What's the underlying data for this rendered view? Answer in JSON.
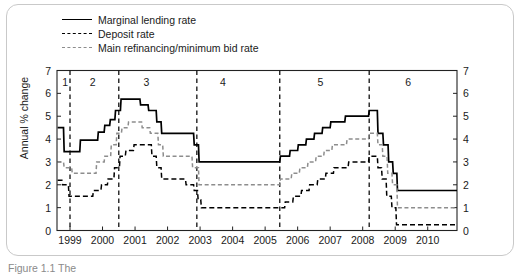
{
  "figure": {
    "caption": "Figure 1.1 The",
    "ylabel": "Annual % change"
  },
  "legend": {
    "position": "top-left",
    "items": [
      {
        "label": "Marginal lending rate",
        "style": "solid",
        "color": "#000000"
      },
      {
        "label": "Deposit rate",
        "style": "dashed",
        "color": "#000000"
      },
      {
        "label": "Main refinancing/minimum bid rate",
        "style": "dashed",
        "color": "#8d8d8d"
      }
    ]
  },
  "chart_data": {
    "type": "line",
    "title": "",
    "xlabel": "",
    "ylabel": "Annual % change",
    "ylim": [
      0,
      7
    ],
    "yticks": [
      0,
      1,
      2,
      3,
      4,
      5,
      6,
      7
    ],
    "right_axis": true,
    "right_yticks": [
      0,
      1,
      2,
      3,
      4,
      5,
      6,
      7
    ],
    "xlim": [
      1998.6,
      2010.9
    ],
    "xticks": [
      1999,
      2000,
      2001,
      2002,
      2003,
      2004,
      2005,
      2006,
      2007,
      2008,
      2009,
      2010
    ],
    "xticklabels": [
      "1999",
      "2000",
      "2001",
      "2002",
      "2003",
      "2004",
      "2005",
      "2006",
      "2007",
      "2008",
      "2009",
      "2010"
    ],
    "grid": false,
    "step": "post",
    "annotations": [
      {
        "label": "1",
        "x": 1998.85
      },
      {
        "label": "2",
        "x": 1999.7
      },
      {
        "label": "3",
        "x": 2001.35
      },
      {
        "label": "4",
        "x": 2003.7
      },
      {
        "label": "5",
        "x": 2006.7
      },
      {
        "label": "6",
        "x": 2009.4
      }
    ],
    "vlines": [
      1999.0,
      2000.5,
      2002.9,
      2005.45,
      2008.2
    ],
    "series": [
      {
        "name": "Marginal lending rate",
        "style": "solid",
        "color": "#000000",
        "points": [
          [
            1998.62,
            4.5
          ],
          [
            1998.8,
            4.5
          ],
          [
            1998.82,
            3.45
          ],
          [
            1999.3,
            3.45
          ],
          [
            1999.32,
            3.95
          ],
          [
            1999.85,
            3.95
          ],
          [
            1999.87,
            4.3
          ],
          [
            2000.05,
            4.3
          ],
          [
            2000.07,
            4.6
          ],
          [
            2000.22,
            4.6
          ],
          [
            2000.24,
            4.85
          ],
          [
            2000.38,
            4.85
          ],
          [
            2000.4,
            5.25
          ],
          [
            2000.55,
            5.25
          ],
          [
            2000.57,
            5.75
          ],
          [
            2000.8,
            5.75
          ],
          [
            2000.82,
            5.75
          ],
          [
            2001.15,
            5.75
          ],
          [
            2001.17,
            5.5
          ],
          [
            2001.4,
            5.5
          ],
          [
            2001.42,
            5.25
          ],
          [
            2001.65,
            5.25
          ],
          [
            2001.67,
            4.75
          ],
          [
            2001.8,
            4.75
          ],
          [
            2001.82,
            4.25
          ],
          [
            2002.8,
            4.25
          ],
          [
            2002.82,
            3.75
          ],
          [
            2002.95,
            3.75
          ],
          [
            2002.97,
            3.0
          ],
          [
            2005.45,
            3.0
          ],
          [
            2005.47,
            3.25
          ],
          [
            2005.75,
            3.25
          ],
          [
            2005.77,
            3.5
          ],
          [
            2006.0,
            3.5
          ],
          [
            2006.02,
            3.75
          ],
          [
            2006.25,
            3.75
          ],
          [
            2006.27,
            4.0
          ],
          [
            2006.5,
            4.0
          ],
          [
            2006.52,
            4.25
          ],
          [
            2006.75,
            4.25
          ],
          [
            2006.77,
            4.5
          ],
          [
            2007.0,
            4.5
          ],
          [
            2007.02,
            4.75
          ],
          [
            2007.45,
            4.75
          ],
          [
            2007.47,
            5.0
          ],
          [
            2008.18,
            5.0
          ],
          [
            2008.2,
            5.25
          ],
          [
            2008.45,
            5.25
          ],
          [
            2008.47,
            4.25
          ],
          [
            2008.62,
            4.25
          ],
          [
            2008.64,
            3.75
          ],
          [
            2008.78,
            3.75
          ],
          [
            2008.8,
            3.0
          ],
          [
            2008.92,
            3.0
          ],
          [
            2008.94,
            2.5
          ],
          [
            2009.05,
            2.5
          ],
          [
            2009.07,
            1.75
          ],
          [
            2010.9,
            1.75
          ]
        ]
      },
      {
        "name": "Main refinancing/minimum bid rate",
        "style": "dashed",
        "color": "#8d8d8d",
        "points": [
          [
            1998.62,
            3.0
          ],
          [
            1998.8,
            3.0
          ],
          [
            1998.82,
            2.75
          ],
          [
            1999.05,
            2.75
          ],
          [
            1999.07,
            2.5
          ],
          [
            1999.3,
            2.5
          ],
          [
            1999.32,
            2.5
          ],
          [
            1999.8,
            2.5
          ],
          [
            1999.82,
            3.0
          ],
          [
            2000.05,
            3.0
          ],
          [
            2000.07,
            3.25
          ],
          [
            2000.25,
            3.25
          ],
          [
            2000.27,
            3.75
          ],
          [
            2000.42,
            3.75
          ],
          [
            2000.44,
            4.25
          ],
          [
            2000.58,
            4.25
          ],
          [
            2000.6,
            4.5
          ],
          [
            2000.78,
            4.5
          ],
          [
            2000.8,
            4.75
          ],
          [
            2001.2,
            4.75
          ],
          [
            2001.22,
            4.5
          ],
          [
            2001.45,
            4.5
          ],
          [
            2001.47,
            4.25
          ],
          [
            2001.7,
            4.25
          ],
          [
            2001.72,
            3.75
          ],
          [
            2001.85,
            3.75
          ],
          [
            2001.87,
            3.25
          ],
          [
            2002.75,
            3.25
          ],
          [
            2002.77,
            2.75
          ],
          [
            2002.95,
            2.75
          ],
          [
            2002.97,
            2.0
          ],
          [
            2005.45,
            2.0
          ],
          [
            2005.47,
            2.25
          ],
          [
            2005.8,
            2.25
          ],
          [
            2005.82,
            2.5
          ],
          [
            2006.05,
            2.5
          ],
          [
            2006.07,
            2.75
          ],
          [
            2006.3,
            2.75
          ],
          [
            2006.32,
            3.0
          ],
          [
            2006.55,
            3.0
          ],
          [
            2006.57,
            3.25
          ],
          [
            2006.8,
            3.25
          ],
          [
            2006.82,
            3.5
          ],
          [
            2007.05,
            3.5
          ],
          [
            2007.07,
            3.75
          ],
          [
            2007.5,
            3.75
          ],
          [
            2007.52,
            4.0
          ],
          [
            2008.18,
            4.0
          ],
          [
            2008.2,
            4.25
          ],
          [
            2008.45,
            4.25
          ],
          [
            2008.47,
            3.75
          ],
          [
            2008.6,
            3.75
          ],
          [
            2008.62,
            3.25
          ],
          [
            2008.75,
            3.25
          ],
          [
            2008.77,
            2.5
          ],
          [
            2008.9,
            2.5
          ],
          [
            2008.92,
            2.0
          ],
          [
            2009.05,
            2.0
          ],
          [
            2009.07,
            1.0
          ],
          [
            2010.9,
            1.0
          ]
        ]
      },
      {
        "name": "Deposit rate",
        "style": "dashed",
        "color": "#000000",
        "points": [
          [
            1998.62,
            2.2
          ],
          [
            1998.75,
            2.2
          ],
          [
            1998.77,
            2.0
          ],
          [
            1998.95,
            2.0
          ],
          [
            1998.97,
            1.5
          ],
          [
            1999.45,
            1.5
          ],
          [
            1999.47,
            1.5
          ],
          [
            1999.7,
            1.5
          ],
          [
            1999.72,
            1.75
          ],
          [
            1999.95,
            1.75
          ],
          [
            1999.97,
            2.0
          ],
          [
            2000.15,
            2.0
          ],
          [
            2000.17,
            2.25
          ],
          [
            2000.35,
            2.25
          ],
          [
            2000.37,
            2.75
          ],
          [
            2000.52,
            2.75
          ],
          [
            2000.54,
            3.25
          ],
          [
            2000.7,
            3.25
          ],
          [
            2000.72,
            3.5
          ],
          [
            2000.95,
            3.5
          ],
          [
            2000.97,
            3.75
          ],
          [
            2001.25,
            3.75
          ],
          [
            2001.27,
            3.75
          ],
          [
            2001.5,
            3.75
          ],
          [
            2001.52,
            3.25
          ],
          [
            2001.65,
            3.25
          ],
          [
            2001.67,
            2.75
          ],
          [
            2001.8,
            2.75
          ],
          [
            2001.82,
            2.25
          ],
          [
            2002.55,
            2.25
          ],
          [
            2002.57,
            2.0
          ],
          [
            2002.8,
            2.0
          ],
          [
            2002.82,
            1.75
          ],
          [
            2002.92,
            1.75
          ],
          [
            2002.94,
            1.35
          ],
          [
            2003.02,
            1.35
          ],
          [
            2003.04,
            1.0
          ],
          [
            2005.45,
            1.0
          ],
          [
            2005.47,
            1.0
          ],
          [
            2005.6,
            1.0
          ],
          [
            2005.62,
            1.25
          ],
          [
            2005.85,
            1.25
          ],
          [
            2005.87,
            1.5
          ],
          [
            2006.1,
            1.5
          ],
          [
            2006.12,
            1.75
          ],
          [
            2006.35,
            1.75
          ],
          [
            2006.37,
            2.0
          ],
          [
            2006.6,
            2.0
          ],
          [
            2006.62,
            2.25
          ],
          [
            2006.85,
            2.25
          ],
          [
            2006.87,
            2.5
          ],
          [
            2007.1,
            2.5
          ],
          [
            2007.12,
            2.75
          ],
          [
            2007.55,
            2.75
          ],
          [
            2007.57,
            3.0
          ],
          [
            2008.18,
            3.0
          ],
          [
            2008.2,
            3.25
          ],
          [
            2008.45,
            3.25
          ],
          [
            2008.47,
            2.75
          ],
          [
            2008.58,
            2.75
          ],
          [
            2008.6,
            2.25
          ],
          [
            2008.72,
            2.25
          ],
          [
            2008.74,
            1.5
          ],
          [
            2008.88,
            1.5
          ],
          [
            2008.9,
            1.0
          ],
          [
            2009.02,
            1.0
          ],
          [
            2009.04,
            0.25
          ],
          [
            2010.9,
            0.25
          ]
        ]
      }
    ]
  }
}
